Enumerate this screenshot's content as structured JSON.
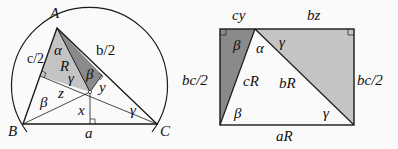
{
  "left_figure": {
    "vertices": {
      "A": "A",
      "B": "B",
      "C": "C"
    },
    "labels": {
      "half_c": "c/2",
      "half_b": "b/2",
      "side_a": "a",
      "radius": "R",
      "alpha": "α",
      "beta_top": "β",
      "gamma_top": "γ",
      "beta_left": "β",
      "gamma_right": "γ",
      "x": "x",
      "y": "y",
      "z": "z"
    }
  },
  "right_figure": {
    "labels": {
      "top_left": "cy",
      "top_right": "bz",
      "left_side": "bc/2",
      "right_side": "bc/2",
      "bottom": "aR",
      "cR": "cR",
      "bR": "bR",
      "beta_top": "β",
      "alpha": "α",
      "gamma_top": "γ",
      "beta_bottom": "β",
      "gamma_bottom": "γ"
    }
  },
  "colors": {
    "light_gray": "#c4c4c4",
    "dark_gray": "#8a8a8a",
    "stroke": "#1a1a1a"
  }
}
